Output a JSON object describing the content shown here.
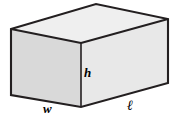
{
  "figure": {
    "name": "rectangular-box-diagram",
    "background_color": "#ffffff",
    "edge_color": "#231f20",
    "faces": {
      "top": {
        "name": "top-face",
        "fill": "#efefef",
        "points": "11,29 96,4 168,19 81,43"
      },
      "left": {
        "name": "left-front-face",
        "fill": "#d9d9d9",
        "points": "11,29 81,43 81,107 11,95"
      },
      "right": {
        "name": "right-front-face",
        "fill": "#e8e8e8",
        "points": "81,43 168,19 168,83 81,107"
      }
    },
    "labels": [
      {
        "id": "h",
        "text": "h",
        "name": "height-label",
        "meaning": "height"
      },
      {
        "id": "w",
        "text": "w",
        "name": "width-label",
        "meaning": "width"
      },
      {
        "id": "l",
        "text": "ℓ",
        "name": "length-label",
        "meaning": "length"
      }
    ]
  }
}
